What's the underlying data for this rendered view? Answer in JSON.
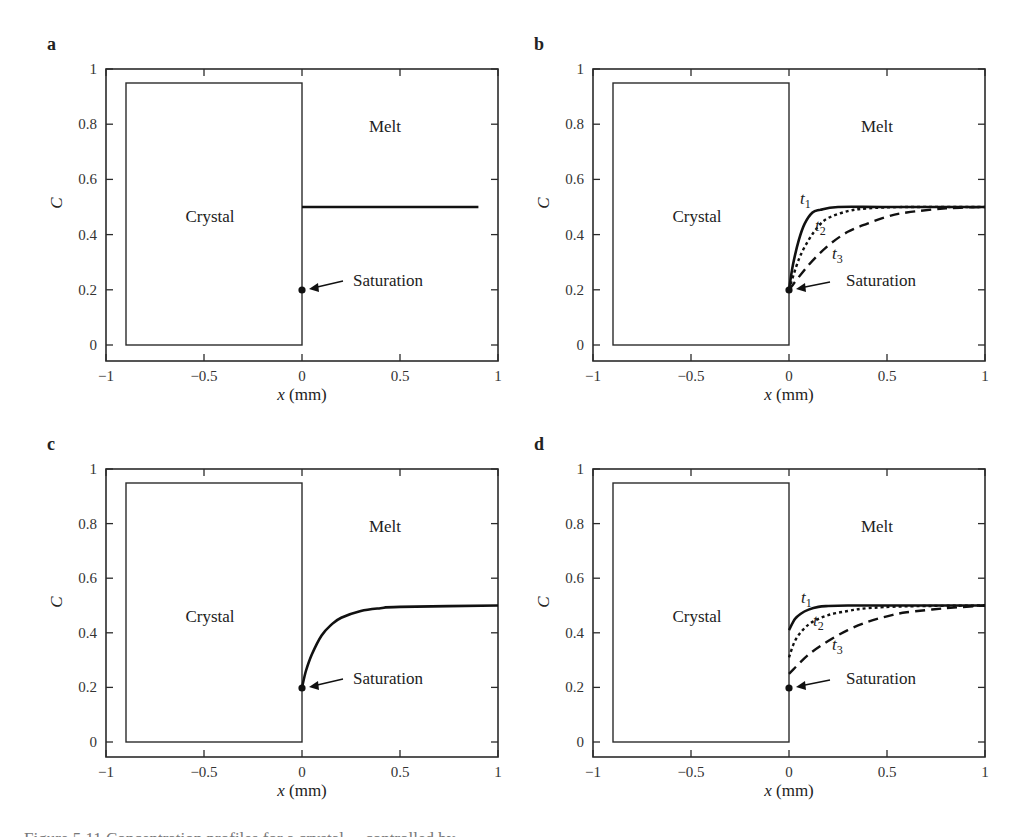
{
  "chart_data": [
    {
      "panel": "a",
      "type": "line",
      "xlabel": "x (mm)",
      "ylabel": "C",
      "xlim": [
        -1,
        1
      ],
      "ylim": [
        -0.06,
        1
      ],
      "xticks": [
        "-1",
        "-0.5",
        "0",
        "0.5",
        "1"
      ],
      "yticks": [
        "0",
        "0.2",
        "0.4",
        "0.6",
        "0.8",
        "1"
      ],
      "regions": {
        "crystal": "Crystal",
        "melt": "Melt"
      },
      "crystal_box": {
        "x": [
          -0.9,
          0
        ],
        "C": [
          0,
          0.95
        ]
      },
      "annotation": {
        "label": "Saturation",
        "point": [
          0,
          0.2
        ]
      },
      "series": [
        {
          "name": "initial",
          "style": "solid",
          "x": [
            0,
            0.9
          ],
          "C": [
            0.5,
            0.5
          ]
        }
      ]
    },
    {
      "panel": "b",
      "type": "line",
      "xlabel": "x (mm)",
      "ylabel": "C",
      "xlim": [
        -1,
        1
      ],
      "ylim": [
        -0.06,
        1
      ],
      "xticks": [
        "-1",
        "-0.5",
        "0",
        "0.5",
        "1"
      ],
      "yticks": [
        "0",
        "0.2",
        "0.4",
        "0.6",
        "0.8",
        "1"
      ],
      "regions": {
        "crystal": "Crystal",
        "melt": "Melt"
      },
      "crystal_box": {
        "x": [
          -0.9,
          0
        ],
        "C": [
          0,
          0.95
        ]
      },
      "annotation": {
        "label": "Saturation",
        "point": [
          0,
          0.2
        ]
      },
      "series": [
        {
          "name": "t1",
          "style": "solid",
          "x": [
            0,
            0.02,
            0.05,
            0.08,
            0.12,
            0.16,
            0.25,
            0.5,
            1.0
          ],
          "C": [
            0.2,
            0.29,
            0.38,
            0.44,
            0.48,
            0.49,
            0.5,
            0.5,
            0.5
          ]
        },
        {
          "name": "t2",
          "style": "dotted",
          "x": [
            0,
            0.05,
            0.1,
            0.15,
            0.2,
            0.3,
            0.4,
            0.6,
            1.0
          ],
          "C": [
            0.2,
            0.31,
            0.38,
            0.43,
            0.46,
            0.485,
            0.495,
            0.5,
            0.5
          ]
        },
        {
          "name": "t3",
          "style": "dashed",
          "x": [
            0,
            0.1,
            0.2,
            0.3,
            0.4,
            0.5,
            0.6,
            0.8,
            1.0
          ],
          "C": [
            0.2,
            0.29,
            0.36,
            0.41,
            0.44,
            0.465,
            0.48,
            0.495,
            0.5
          ]
        }
      ],
      "curve_labels": [
        "t1",
        "t2",
        "t3"
      ]
    },
    {
      "panel": "c",
      "type": "line",
      "xlabel": "x (mm)",
      "ylabel": "C",
      "xlim": [
        -1,
        1
      ],
      "ylim": [
        -0.06,
        1
      ],
      "xticks": [
        "-1",
        "-0.5",
        "0",
        "0.5",
        "1"
      ],
      "yticks": [
        "0",
        "0.2",
        "0.4",
        "0.6",
        "0.8",
        "1"
      ],
      "regions": {
        "crystal": "Crystal",
        "melt": "Melt"
      },
      "crystal_box": {
        "x": [
          -0.9,
          0
        ],
        "C": [
          0,
          0.95
        ]
      },
      "annotation": {
        "label": "Saturation",
        "point": [
          0,
          0.2
        ]
      },
      "series": [
        {
          "name": "steady",
          "style": "solid",
          "x": [
            0,
            0.02,
            0.05,
            0.1,
            0.15,
            0.2,
            0.3,
            0.4,
            0.5,
            1.0
          ],
          "C": [
            0.2,
            0.26,
            0.32,
            0.39,
            0.43,
            0.455,
            0.48,
            0.49,
            0.495,
            0.5
          ]
        }
      ]
    },
    {
      "panel": "d",
      "type": "line",
      "xlabel": "x (mm)",
      "ylabel": "C",
      "xlim": [
        -1,
        1
      ],
      "ylim": [
        -0.06,
        1
      ],
      "xticks": [
        "-1",
        "-0.5",
        "0",
        "0.5",
        "1"
      ],
      "yticks": [
        "0",
        "0.2",
        "0.4",
        "0.6",
        "0.8",
        "1"
      ],
      "regions": {
        "crystal": "Crystal",
        "melt": "Melt"
      },
      "crystal_box": {
        "x": [
          -0.9,
          0
        ],
        "C": [
          0,
          0.95
        ]
      },
      "annotation": {
        "label": "Saturation",
        "point": [
          0,
          0.2
        ]
      },
      "series": [
        {
          "name": "t1",
          "style": "solid",
          "x": [
            0,
            0.03,
            0.06,
            0.1,
            0.15,
            0.2,
            0.3,
            0.5,
            1.0
          ],
          "C": [
            0.41,
            0.45,
            0.47,
            0.485,
            0.495,
            0.498,
            0.5,
            0.5,
            0.5
          ]
        },
        {
          "name": "t2",
          "style": "dotted",
          "x": [
            0,
            0.03,
            0.07,
            0.12,
            0.2,
            0.3,
            0.4,
            0.6,
            1.0
          ],
          "C": [
            0.31,
            0.37,
            0.41,
            0.44,
            0.465,
            0.48,
            0.49,
            0.497,
            0.5
          ]
        },
        {
          "name": "t3",
          "style": "dashed",
          "x": [
            0,
            0.1,
            0.2,
            0.3,
            0.4,
            0.5,
            0.6,
            0.8,
            1.0
          ],
          "C": [
            0.25,
            0.32,
            0.37,
            0.41,
            0.44,
            0.46,
            0.475,
            0.49,
            0.5
          ]
        }
      ],
      "curve_labels": [
        "t1",
        "t2",
        "t3"
      ]
    }
  ],
  "panels": {
    "a": {
      "letter": "a",
      "crystal": "Crystal",
      "melt": "Melt",
      "saturation": "Saturation",
      "xlabel_var": "x",
      "xlabel_unit": " (mm)",
      "ylabel": "C"
    },
    "b": {
      "letter": "b",
      "crystal": "Crystal",
      "melt": "Melt",
      "saturation": "Saturation",
      "xlabel_var": "x",
      "xlabel_unit": " (mm)",
      "ylabel": "C",
      "t1": "t",
      "t1_sub": "1",
      "t2": "t",
      "t2_sub": "2",
      "t3": "t",
      "t3_sub": "3"
    },
    "c": {
      "letter": "c",
      "crystal": "Crystal",
      "melt": "Melt",
      "saturation": "Saturation",
      "xlabel_var": "x",
      "xlabel_unit": " (mm)",
      "ylabel": "C"
    },
    "d": {
      "letter": "d",
      "crystal": "Crystal",
      "melt": "Melt",
      "saturation": "Saturation",
      "xlabel_var": "x",
      "xlabel_unit": " (mm)",
      "ylabel": "C",
      "t1": "t",
      "t1_sub": "1",
      "t2": "t",
      "t2_sub": "2",
      "t3": "t",
      "t3_sub": "3"
    }
  },
  "ticks": {
    "x": [
      "−1",
      "−0.5",
      "0",
      "0.5",
      "1"
    ],
    "y": [
      "0",
      "0.2",
      "0.4",
      "0.6",
      "0.8",
      "1"
    ]
  },
  "caption": "Figure 5.11 Concentration profiles for a crystal ... controlled by ..."
}
